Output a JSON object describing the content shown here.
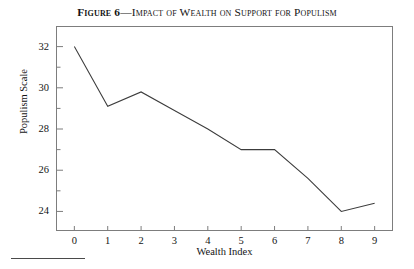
{
  "figure": {
    "title_lead": "Figure 6",
    "title_rest": "—Impact of Wealth on Support for Populism",
    "title_full": "Figure 6—Impact of Wealth on Support for Populism"
  },
  "chart_data": {
    "type": "line",
    "title": "Figure 6—Impact of Wealth on Support for Populism",
    "xlabel": "Wealth Index",
    "ylabel": "Populism Scale",
    "x": [
      0,
      1,
      2,
      3,
      4,
      5,
      6,
      7,
      8,
      9
    ],
    "values": [
      32.0,
      29.1,
      29.8,
      28.9,
      28.0,
      27.0,
      27.0,
      25.6,
      24.0,
      24.4
    ],
    "xtick_labels": [
      "0",
      "1",
      "2",
      "3",
      "4",
      "5",
      "6",
      "7",
      "8",
      "9"
    ],
    "ytick_labels": [
      "24",
      "26",
      "28",
      "30",
      "32"
    ],
    "ytick_values": [
      24,
      26,
      28,
      30,
      32
    ],
    "yminor_values": [
      25,
      27,
      29,
      31,
      33
    ],
    "xlim": [
      -0.55,
      9.55
    ],
    "ylim": [
      23.05,
      33.0
    ],
    "grid": false,
    "legend": false,
    "line_color": "#3c3c3c",
    "frame_color": "#7d7d7d"
  }
}
